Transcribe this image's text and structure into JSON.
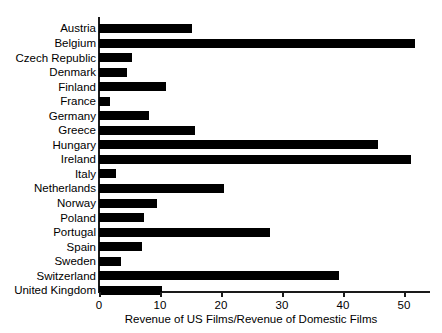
{
  "chart_data": {
    "type": "bar",
    "orientation": "horizontal",
    "title": "",
    "xlabel": "Revenue of US Films/Revenue of Domestic Films",
    "ylabel": "",
    "xlim": [
      0,
      54
    ],
    "grid": false,
    "legend": null,
    "xticks": [
      0,
      10,
      20,
      30,
      40,
      50
    ],
    "categories": [
      "Austria",
      "Belgium",
      "Czech Republic",
      "Denmark",
      "Finland",
      "France",
      "Germany",
      "Greece",
      "Hungary",
      "Ireland",
      "Italy",
      "Netherlands",
      "Norway",
      "Poland",
      "Portugal",
      "Spain",
      "Sweden",
      "Switzerland",
      "United Kingdom"
    ],
    "values": [
      15.3,
      51.8,
      5.4,
      4.6,
      11.0,
      1.8,
      8.2,
      15.7,
      45.7,
      51.2,
      2.8,
      20.5,
      9.5,
      7.4,
      28.0,
      7.0,
      3.6,
      39.4,
      10.3
    ],
    "bar_color": "#000000",
    "axis_color": "#1a1a1a"
  }
}
